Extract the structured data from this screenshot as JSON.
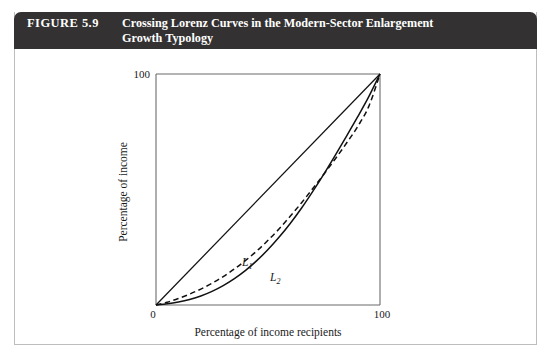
{
  "figure": {
    "number_label": "FIGURE 5.9",
    "title_line1": "Crossing Lorenz Curves in the Modern-Sector Enlargement",
    "title_line2": "Growth Typology",
    "banner_color": "#333132",
    "banner_text_color": "#ffffff",
    "border_color": "#bdbdbd"
  },
  "chart_data": {
    "type": "line",
    "title": "Crossing Lorenz Curves in the Modern-Sector Enlargement Growth Typology",
    "xlabel": "Percentage of income recipients",
    "ylabel": "Percentage of income",
    "xlim": [
      0,
      100
    ],
    "ylim": [
      0,
      100
    ],
    "xticks": [
      0,
      100
    ],
    "xtick_labels": [
      "0",
      "100"
    ],
    "yticks": [
      100
    ],
    "ytick_labels": [
      "100"
    ],
    "grid": false,
    "legend": "inline-annotations",
    "axis_color": "#555555",
    "curve_color": "#111111",
    "series": [
      {
        "name": "Line of equality",
        "label": "",
        "style": "solid",
        "annotation": "",
        "x": [
          0,
          100
        ],
        "y": [
          0,
          100
        ]
      },
      {
        "name": "L1",
        "label": "L1",
        "label_text": "L",
        "label_sub": "1",
        "style": "dashed",
        "annotation_x": 40,
        "annotation_y": 21,
        "x": [
          0,
          5,
          10,
          15,
          20,
          25,
          30,
          35,
          40,
          45,
          50,
          55,
          60,
          65,
          70,
          75,
          80,
          85,
          90,
          95,
          100
        ],
        "y": [
          0,
          1.2,
          2.8,
          4.7,
          6.9,
          9.4,
          12.3,
          15.6,
          19.3,
          23.4,
          28.0,
          33.0,
          38.5,
          44.3,
          50.4,
          56.7,
          63.2,
          70.0,
          77.2,
          86.0,
          100
        ]
      },
      {
        "name": "L2",
        "label": "L2",
        "label_text": "L",
        "label_sub": "2",
        "style": "solid",
        "annotation_x": 53,
        "annotation_y": 14,
        "x": [
          0,
          5,
          10,
          15,
          20,
          25,
          30,
          35,
          40,
          45,
          50,
          55,
          60,
          65,
          70,
          75,
          80,
          85,
          90,
          95,
          100
        ],
        "y": [
          0,
          0.5,
          1.3,
          2.4,
          3.9,
          5.9,
          8.4,
          11.4,
          15.0,
          19.2,
          24.0,
          29.4,
          35.4,
          42.0,
          49.2,
          56.8,
          64.8,
          73.0,
          81.4,
          90.2,
          100
        ]
      }
    ],
    "crossing_point": {
      "x": 77,
      "y": 60
    }
  }
}
